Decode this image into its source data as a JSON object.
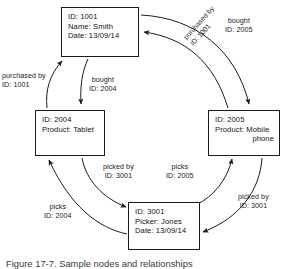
{
  "figure": {
    "caption": "Figure 17-7. Sample nodes and relationships"
  },
  "colors": {
    "stroke": "#1b1b1b",
    "node_border": "#1b1b1b",
    "background": "#ffffff",
    "text": "#111111"
  },
  "nodes": [
    {
      "key": "person",
      "lines": [
        "ID: 1001",
        "Name: Smith",
        "Date: 13/09/14"
      ]
    },
    {
      "key": "product_tablet",
      "lines": [
        "ID: 2004",
        "Product: Tablet"
      ]
    },
    {
      "key": "product_mobile",
      "lines": [
        "ID: 2005",
        "Product: Mobile",
        "phone"
      ]
    },
    {
      "key": "picker",
      "lines": [
        "ID: 3001",
        "Picker: Jones",
        "Date: 13/09/14"
      ]
    }
  ],
  "edges": [
    {
      "key": "purchased_by_1001",
      "from": "product_tablet",
      "to": "person",
      "type": "purchased by",
      "id_line": "ID: 1001"
    },
    {
      "key": "bought_2004",
      "from": "person",
      "to": "product_tablet",
      "type": "bought",
      "id_line": "ID: 2004"
    },
    {
      "key": "bought_2005",
      "from": "person",
      "to": "product_mobile",
      "type": "bought",
      "id_line": "ID: 2005"
    },
    {
      "key": "purchased_by_1001b",
      "from": "product_mobile",
      "to": "person",
      "type": "purchased by",
      "id_line": "ID: 1001"
    },
    {
      "key": "picked_by_3001",
      "from": "product_tablet",
      "to": "picker",
      "type": "picked by",
      "id_line": "ID: 3001"
    },
    {
      "key": "picks_2005",
      "from": "picker",
      "to": "product_mobile",
      "type": "picks",
      "id_line": "ID: 2005"
    },
    {
      "key": "picked_by_3001b",
      "from": "product_mobile",
      "to": "picker",
      "type": "picked by",
      "id_line": "ID: 3001"
    },
    {
      "key": "picks_2004",
      "from": "picker",
      "to": "product_tablet",
      "type": "picks",
      "id_line": "ID: 2004"
    }
  ]
}
